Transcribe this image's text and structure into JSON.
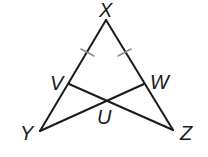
{
  "diagram": {
    "type": "geometry-triangle",
    "points": {
      "X": {
        "label": "X",
        "x": 106,
        "y": 20
      },
      "Y": {
        "label": "Y",
        "x": 40,
        "y": 131
      },
      "Z": {
        "label": "Z",
        "x": 173,
        "y": 130
      },
      "V": {
        "label": "V",
        "x": 69,
        "y": 84
      },
      "W": {
        "label": "W",
        "x": 144,
        "y": 84
      },
      "U": {
        "label": "U",
        "x": 107,
        "y": 100
      }
    },
    "segments": [
      "XY",
      "XZ",
      "YW",
      "ZV"
    ],
    "congruence_marks": [
      "XV",
      "XW"
    ],
    "colors": {
      "line": "#1a1a1a",
      "tick": "#8a8a8a",
      "background": "#ffffff"
    }
  }
}
